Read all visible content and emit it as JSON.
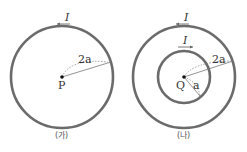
{
  "figures": [
    {
      "caption": "(가)",
      "center_label": "P",
      "current_label": "I",
      "current_direction": "counterclockwise (arrow pointing left at top)",
      "loops": [
        {
          "radius_label": "2a"
        }
      ]
    },
    {
      "caption": "(나)",
      "center_label": "Q",
      "loops": [
        {
          "radius_label": "2a",
          "current_label": "I",
          "current_direction": "counterclockwise (arrow pointing left at top)"
        },
        {
          "radius_label": "a",
          "current_label": "I",
          "current_direction": "clockwise (arrow pointing right at top)"
        }
      ]
    }
  ],
  "colors": {
    "loop": "#6b6b6b",
    "text": "#333333"
  }
}
